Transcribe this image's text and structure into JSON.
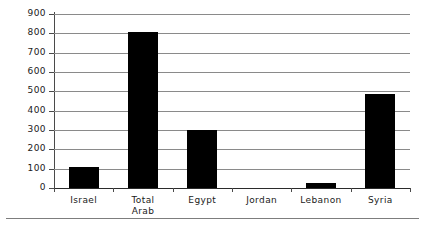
{
  "chart_data": {
    "type": "bar",
    "title": "",
    "subtitle": "",
    "xlabel": "",
    "ylabel": "",
    "categories": [
      "Israel",
      "Total\nArab",
      "Egypt",
      "Jordan",
      "Lebanon",
      "Syria"
    ],
    "values": [
      110,
      805,
      300,
      0,
      27,
      485
    ],
    "ylim": [
      0,
      900
    ],
    "ytick_step": 100,
    "yticks": [
      900,
      800,
      700,
      600,
      500,
      400,
      300,
      200,
      100,
      0
    ],
    "ytick_labels": [
      "900",
      "800",
      "700",
      "600",
      "500",
      "400",
      "300",
      "200",
      "100",
      "0"
    ],
    "grid": true,
    "grid_axis": "y",
    "legend": false,
    "legend_position": "none",
    "series": [
      {
        "name": "",
        "color": "#000000",
        "values": [
          110,
          805,
          300,
          0,
          27,
          485
        ]
      }
    ]
  },
  "axis": {
    "y_label_color": "#1a1a1a",
    "gridline_color": "#8a8a8a",
    "axis_color": "#4a4a4a",
    "bar_color": "#000000",
    "background": "#ffffff"
  },
  "footer": {
    "rule_color": "#7d7d7d"
  }
}
